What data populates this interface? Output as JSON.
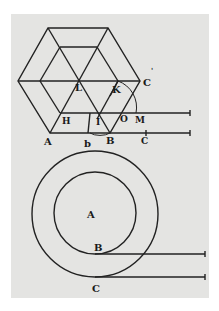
{
  "figure": {
    "background": "#e4e4e2",
    "ink": "#222222",
    "top_diagram": {
      "description": "Hexagon subdivided into rhombi with measuring lines",
      "labels": {
        "A": "A",
        "b": "b",
        "B": "B",
        "C": "C",
        "C_prime": "'",
        "H": "H",
        "I": "I",
        "K": "K",
        "L": "L",
        "O": "O",
        "M": "M",
        "c": "C"
      }
    },
    "bottom_diagram": {
      "description": "Two concentric circles with tangent lines",
      "labels": {
        "A": "A",
        "B": "B",
        "C": "C"
      }
    }
  }
}
